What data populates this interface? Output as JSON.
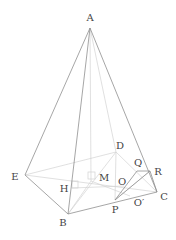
{
  "diagram": {
    "type": "pyramid",
    "colors": {
      "edge": "#8a8a8a",
      "hidden": "#cfcfcf",
      "label": "#444444"
    },
    "points": {
      "A": {
        "label": "A",
        "x": 90,
        "y": 28,
        "lx": 90,
        "ly": 21
      },
      "E": {
        "label": "E",
        "x": 25,
        "y": 175,
        "lx": 15,
        "ly": 180
      },
      "B": {
        "label": "B",
        "x": 68,
        "y": 214,
        "lx": 63,
        "ly": 226
      },
      "C": {
        "label": "C",
        "x": 157,
        "y": 192,
        "lx": 164,
        "ly": 200
      },
      "D": {
        "label": "D",
        "x": 116,
        "y": 152,
        "lx": 119,
        "ly": 149
      },
      "H": {
        "label": "H",
        "x": 72,
        "y": 188,
        "lx": 63,
        "ly": 192
      },
      "M": {
        "label": "M",
        "x": 91,
        "y": 181,
        "lx": 104,
        "ly": 181
      },
      "O": {
        "label": "O",
        "x": 124,
        "y": 186,
        "lx": 122,
        "ly": 185
      },
      "Q": {
        "label": "Q",
        "x": 137,
        "y": 171,
        "lx": 137,
        "ly": 166
      },
      "R": {
        "label": "R",
        "x": 150,
        "y": 171,
        "lx": 158,
        "ly": 175
      },
      "P": {
        "label": "P",
        "x": 115,
        "y": 200,
        "lx": 115,
        "ly": 213
      },
      "O2": {
        "label": "O′",
        "x": 130,
        "y": 196,
        "lx": 139,
        "ly": 206
      }
    }
  }
}
